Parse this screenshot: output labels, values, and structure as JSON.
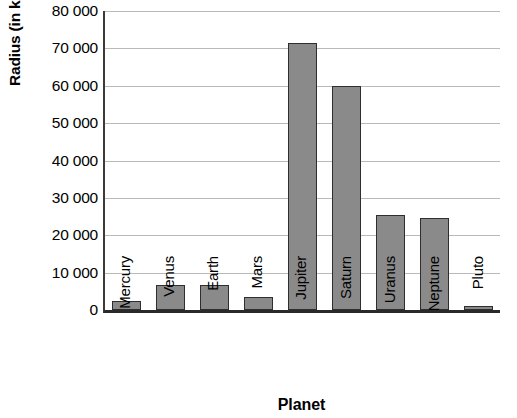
{
  "chart_data": {
    "type": "bar",
    "title": "",
    "xlabel": "Planet",
    "ylabel": "Radius (in km)",
    "categories": [
      "Mercury",
      "Venus",
      "Earth",
      "Mars",
      "Jupiter",
      "Saturn",
      "Uranus",
      "Neptune",
      "Pluto"
    ],
    "values": [
      2400,
      6600,
      6800,
      3400,
      71500,
      60000,
      25500,
      24500,
      1200
    ],
    "ylim": [
      0,
      80000
    ],
    "ytick_values": [
      0,
      10000,
      20000,
      30000,
      40000,
      50000,
      60000,
      70000,
      80000
    ],
    "ytick_labels": [
      "0",
      "10 000",
      "20 000",
      "30 000",
      "40 000",
      "50 000",
      "60 000",
      "70 000",
      "80 000"
    ],
    "grid": true,
    "legend": false,
    "bar_color": "#8a8a8a",
    "bar_border_color": "#2e2e2e",
    "gridline_color": "#b9b9b9",
    "axis_color": "#2a2a2a",
    "background_color": "#ffffff"
  }
}
